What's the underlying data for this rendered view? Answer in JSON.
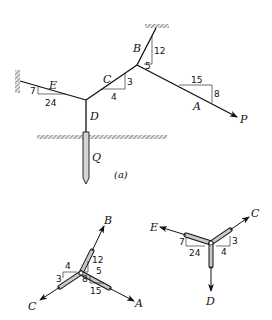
{
  "figure": {
    "caption": "(a)",
    "main_diagram": {
      "members": [
        "A",
        "B",
        "C",
        "D",
        "E"
      ],
      "labels": {
        "A": "A",
        "B": "B",
        "C": "C",
        "D": "D",
        "E": "E",
        "P": "P",
        "Q": "Q"
      },
      "slopes": {
        "B": {
          "rise": "12",
          "run": "5"
        },
        "C": {
          "rise": "3",
          "run": "4"
        },
        "A": {
          "rise": "8",
          "run": "15"
        },
        "E": {
          "rise": "7",
          "run": "24"
        }
      }
    },
    "fbd_left": {
      "labels": {
        "B": "B",
        "C": "C",
        "A": "A"
      },
      "slopes": {
        "B": {
          "rise": "12",
          "run": "5"
        },
        "C": {
          "rise": "3",
          "run": "4"
        },
        "A": {
          "rise": "8",
          "run": "15"
        }
      }
    },
    "fbd_right": {
      "labels": {
        "E": "E",
        "C": "C",
        "D": "D"
      },
      "slopes": {
        "E": {
          "rise": "7",
          "run": "24"
        },
        "C": {
          "rise": "3",
          "run": "4"
        }
      }
    }
  },
  "colors": {
    "line": "#111111",
    "rod_fill": "#c8c8c8",
    "hatch": "#555555"
  }
}
